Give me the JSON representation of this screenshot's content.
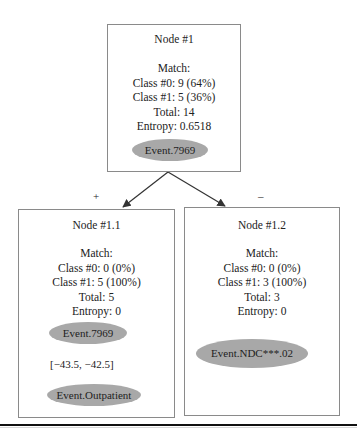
{
  "root": {
    "title": "Node #1",
    "match_label": "Match:",
    "class0": "Class #0: 9 (64%)",
    "class1": "Class #1: 5 (36%)",
    "total": "Total: 14",
    "entropy": "Entropy: 0.6518",
    "event": "Event.7969"
  },
  "left": {
    "branch_sign": "+",
    "title": "Node #1.1",
    "match_label": "Match:",
    "class0": "Class #0: 0 (0%)",
    "class1": "Class #1: 5 (100%)",
    "total": "Total: 5",
    "entropy": "Entropy: 0",
    "event_from": "Event.7969",
    "interval": "[−43.5, −42.5]",
    "event_to": "Event.Outpatient"
  },
  "right": {
    "branch_sign": "–",
    "title": "Node #1.2",
    "match_label": "Match:",
    "class0": "Class #0: 0 (0%)",
    "class1": "Class #1: 3 (100%)",
    "total": "Total: 3",
    "entropy": "Entropy: 0",
    "event": "Event.NDC***.02"
  },
  "colors": {
    "ellipse_fill": "#a8a8a8",
    "border": "#8a8a8a",
    "arrow": "#333333"
  }
}
